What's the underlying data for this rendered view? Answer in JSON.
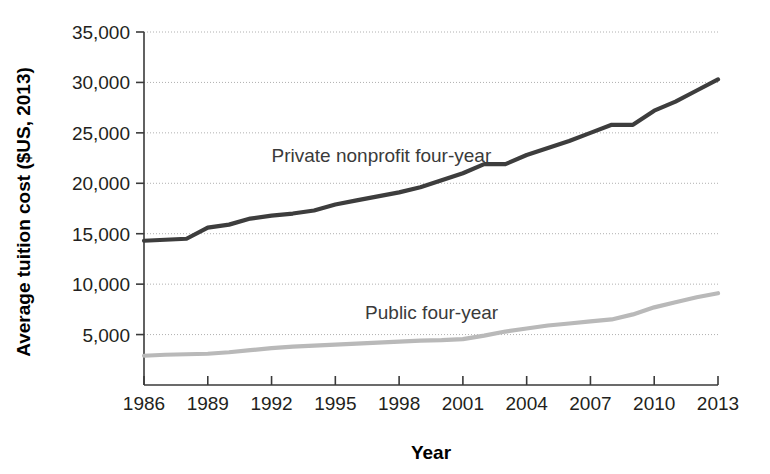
{
  "chart_data": {
    "type": "line",
    "title": "",
    "xlabel": "Year",
    "ylabel": "Average tuition cost ($US, 2013)",
    "xlim": [
      1986,
      2013
    ],
    "ylim": [
      0,
      35000
    ],
    "grid": true,
    "legend_position": "inline-labels",
    "xticks": [
      1986,
      1989,
      1992,
      1995,
      1998,
      2001,
      2004,
      2007,
      2010,
      2013
    ],
    "xtick_labels": [
      "1986",
      "1989",
      "1992",
      "1995",
      "1998",
      "2001",
      "2004",
      "2007",
      "2010",
      "2013"
    ],
    "yticks": [
      5000,
      10000,
      15000,
      20000,
      25000,
      30000,
      35000
    ],
    "ytick_labels": [
      "5,000",
      "10,000",
      "15,000",
      "20,000",
      "25,000",
      "30,000",
      "35,000"
    ],
    "x": [
      1986,
      1987,
      1988,
      1989,
      1990,
      1991,
      1992,
      1993,
      1994,
      1995,
      1996,
      1997,
      1998,
      1999,
      2000,
      2001,
      2002,
      2003,
      2004,
      2005,
      2006,
      2007,
      2008,
      2009,
      2010,
      2011,
      2012,
      2013
    ],
    "series": [
      {
        "name": "Private nonprofit four-year",
        "color": "#3d3d3d",
        "width": 4.2,
        "label_x": 1992.0,
        "label_y": 22100,
        "values": [
          14300,
          14400,
          14500,
          15600,
          15900,
          16500,
          16800,
          17000,
          17300,
          17900,
          18300,
          18700,
          19100,
          19600,
          20300,
          21000,
          21900,
          21900,
          22800,
          23500,
          24200,
          25000,
          25800,
          25800,
          27200,
          28100,
          29200,
          30300
        ]
      },
      {
        "name": "Public four-year",
        "color": "#b9b9b9",
        "width": 4.2,
        "label_x": 1996.4,
        "label_y": 6550,
        "values": [
          2900,
          3000,
          3050,
          3100,
          3250,
          3450,
          3650,
          3800,
          3900,
          4000,
          4100,
          4200,
          4300,
          4400,
          4450,
          4550,
          4900,
          5300,
          5600,
          5900,
          6100,
          6300,
          6500,
          7000,
          7700,
          8200,
          8700,
          9100
        ]
      }
    ]
  },
  "axes": {
    "x_axis_title": "Year",
    "y_axis_title": "Average tuition cost ($US, 2013)"
  },
  "colors": {
    "private_line": "#3d3d3d",
    "public_line": "#b9b9b9",
    "gridline": "#b0b0b0",
    "spine": "#3a3a3a",
    "text": "#231f20",
    "background": "#ffffff"
  }
}
